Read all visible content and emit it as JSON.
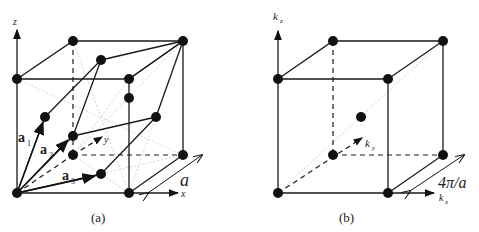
{
  "figure": {
    "panels": [
      {
        "id": "a",
        "caption": "(a)",
        "description": "FCC lattice with primitive vectors",
        "axes": {
          "z": "z",
          "y": "y",
          "x": "x"
        },
        "vectors": [
          {
            "label": "a",
            "subscript": "1"
          },
          {
            "label": "a",
            "subscript": "2"
          },
          {
            "label": "a",
            "subscript": "3"
          }
        ],
        "dimension_label": "a"
      },
      {
        "id": "b",
        "caption": "(b)",
        "description": "Reciprocal lattice (BCC) cube",
        "axes": {
          "z": "k",
          "z_sub": "z",
          "y": "k",
          "y_sub": "y",
          "x": "k",
          "x_sub": "x"
        },
        "dimension_label": "4π/a"
      }
    ]
  }
}
